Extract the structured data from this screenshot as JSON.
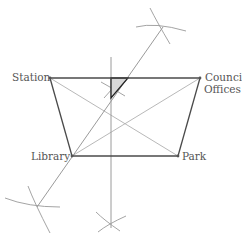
{
  "diagram": {
    "type": "geometric-construction",
    "points": {
      "station": {
        "label": "Station",
        "x": 50,
        "y": 78
      },
      "council_offices": {
        "label_line1": "Council",
        "label_line2": "Offices",
        "x": 200,
        "y": 78
      },
      "library": {
        "label": "Library",
        "x": 72,
        "y": 156
      },
      "park": {
        "label": "Park",
        "x": 178,
        "y": 156
      }
    },
    "edges": [
      [
        "station",
        "council_offices"
      ],
      [
        "council_offices",
        "park"
      ],
      [
        "park",
        "library"
      ],
      [
        "library",
        "station"
      ]
    ],
    "diagonals": [
      [
        "station",
        "park"
      ],
      [
        "council_offices",
        "library"
      ]
    ],
    "construction_lines": [
      {
        "name": "vertical-bisector",
        "x1": 111,
        "y1": 57,
        "x2": 111,
        "y2": 228
      },
      {
        "name": "oblique-bisector",
        "x1": 37,
        "y1": 207,
        "x2": 163,
        "y2": 27
      }
    ],
    "shaded_region": {
      "points": [
        [
          111,
          78
        ],
        [
          128,
          78
        ],
        [
          111,
          98
        ]
      ],
      "fill": "#d8d8d8"
    },
    "colors": {
      "edge": "#4a4a4a",
      "construction": "#9a9a9a",
      "diagonal": "#b0b0b0",
      "label": "#555555"
    }
  }
}
